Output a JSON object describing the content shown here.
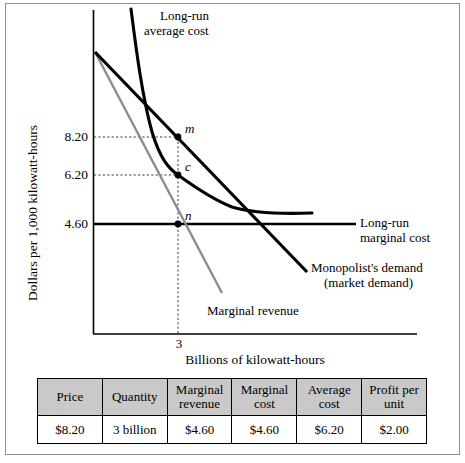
{
  "chart_data": {
    "type": "line",
    "title": "",
    "xlabel": "Billions of kilowatt-hours",
    "ylabel": "Dollars per 1,000 kilowatt-hours",
    "y_ticks": [
      "8.20",
      "6.20",
      "4.60"
    ],
    "x_ticks": [
      "3"
    ],
    "grid": "dashed guide lines at 8.20 and 6.20 to quantity 3",
    "legend_position": "inline annotations",
    "series": [
      {
        "name": "Long-run average cost",
        "style": "curve, thick black, U-shaped flattening",
        "points": [
          [
            0.15,
            13.8
          ],
          [
            0.6,
            9.4
          ],
          [
            1.6,
            7.6
          ],
          [
            3.0,
            6.2
          ],
          [
            4.6,
            5.1
          ],
          [
            6.9,
            4.85
          ]
        ]
      },
      {
        "name": "Monopolist's demand (market demand)",
        "style": "straight line, thick black, downward sloping",
        "points": [
          [
            0.0,
            11.6
          ],
          [
            3.0,
            8.2
          ],
          [
            6.6,
            3.4
          ]
        ]
      },
      {
        "name": "Marginal revenue",
        "style": "straight line, gray, downward sloping",
        "points": [
          [
            0.0,
            11.6
          ],
          [
            3.0,
            4.6
          ],
          [
            4.3,
            2.3
          ]
        ]
      },
      {
        "name": "Long-run marginal cost",
        "style": "horizontal line, thick black",
        "points": [
          [
            0.0,
            4.6
          ],
          [
            8.3,
            4.6
          ]
        ]
      }
    ],
    "annotations": [
      {
        "label": "m",
        "x": 3,
        "y": 8.2,
        "meaning": "monopoly price point on demand"
      },
      {
        "label": "c",
        "x": 3,
        "y": 6.2,
        "meaning": "average cost point"
      },
      {
        "label": "n",
        "x": 3,
        "y": 4.6,
        "meaning": "marginal revenue equals marginal cost"
      }
    ]
  },
  "chart": {
    "axis_labels": {
      "y": "Dollars per 1,000 kilowatt-hours",
      "x": "Billions of kilowatt-hours"
    },
    "y_ticks": [
      {
        "value": "8.20"
      },
      {
        "value": "6.20"
      },
      {
        "value": "4.60"
      }
    ],
    "x_ticks": [
      {
        "value": "3"
      }
    ],
    "curve_labels": {
      "lrac_line1": "Long-run",
      "lrac_line2": "average cost",
      "lrmc_line1": "Long-run",
      "lrmc_line2": "marginal cost",
      "demand_line1": "Monopolist's demand",
      "demand_line2": "(market demand)",
      "mr": "Marginal revenue"
    },
    "point_labels": {
      "m": "m",
      "c": "c",
      "n": "n"
    },
    "colors": {
      "curve": "#000000",
      "marginal_revenue": "#8c8c8c",
      "guide": "#4d4d4d",
      "axis": "#000000"
    }
  },
  "table": {
    "headers": [
      "Price",
      "Quantity",
      "Marginal\nrevenue",
      "Marginal\ncost",
      "Average\ncost",
      "Profit per\nunit"
    ],
    "rows": [
      [
        "$8.20",
        "3 billion",
        "$4.60",
        "$4.60",
        "$6.20",
        "$2.00"
      ]
    ],
    "header_bg": "#c9c9c9"
  }
}
